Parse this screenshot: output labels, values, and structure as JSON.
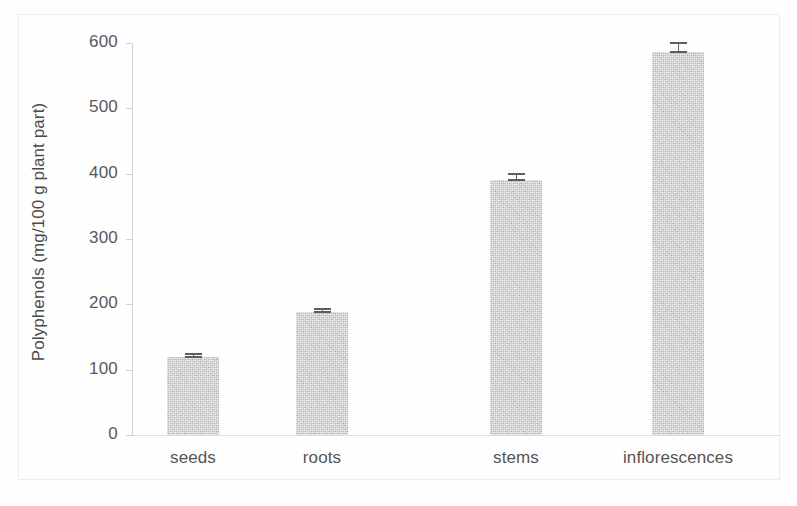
{
  "chart_data": {
    "type": "bar",
    "title": "",
    "xlabel": "",
    "ylabel": "Polyphenols (mg/100 g plant part)",
    "categories": [
      "seeds",
      "roots",
      "stems",
      "inflorescences"
    ],
    "values": [
      119,
      188,
      390,
      586
    ],
    "errors": [
      4,
      3,
      8,
      12
    ],
    "series": [
      {
        "name": "Polyphenols",
        "values": [
          119,
          188,
          390,
          586
        ]
      }
    ],
    "ylim": [
      0,
      600
    ],
    "yticks": [
      0,
      100,
      200,
      300,
      400,
      500,
      600
    ],
    "ytick_labels": [
      "0",
      "100",
      "200",
      "300",
      "400",
      "500",
      "600"
    ],
    "grid": false,
    "legend": false,
    "legend_position": "none",
    "bar_color": "#c4c4c4",
    "error_bar_color": "#5e5e5e",
    "axis_color": "#d2d2d2"
  }
}
